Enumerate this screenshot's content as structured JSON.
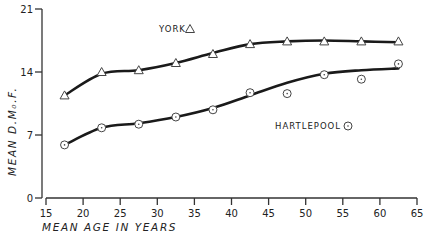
{
  "chart_data": {
    "type": "line",
    "title": "",
    "xlabel": "MEAN AGE IN YEARS",
    "ylabel": "MEAN D.M₀.F.",
    "xlim": [
      15,
      65
    ],
    "ylim": [
      0,
      21
    ],
    "x_ticks": [
      15,
      20,
      25,
      30,
      35,
      40,
      45,
      50,
      55,
      60,
      65
    ],
    "y_ticks": [
      0,
      7,
      14,
      21
    ],
    "grid": false,
    "legend_position": "inline labels",
    "x": [
      17.5,
      22.5,
      27.5,
      32.5,
      37.5,
      42.5,
      47.5,
      52.5,
      57.5,
      62.5
    ],
    "series": [
      {
        "name": "YORK",
        "marker": "triangle",
        "values": [
          11.4,
          14.0,
          14.2,
          15.0,
          16.0,
          17.1,
          17.4,
          17.4,
          17.4,
          17.4
        ],
        "fitted_curve": [
          [
            17.5,
            11.4
          ],
          [
            22.5,
            13.8
          ],
          [
            27.5,
            14.2
          ],
          [
            32.5,
            15.0
          ],
          [
            37.5,
            16.1
          ],
          [
            42.5,
            17.1
          ],
          [
            47.5,
            17.4
          ],
          [
            52.5,
            17.5
          ],
          [
            57.5,
            17.4
          ],
          [
            62.5,
            17.3
          ]
        ]
      },
      {
        "name": "HARTLEPOOL",
        "marker": "circle",
        "values": [
          5.9,
          7.8,
          8.2,
          9.0,
          9.8,
          11.7,
          11.6,
          13.7,
          13.2,
          14.9
        ],
        "fitted_curve": [
          [
            17.5,
            5.9
          ],
          [
            22.5,
            7.8
          ],
          [
            27.5,
            8.3
          ],
          [
            32.5,
            9.0
          ],
          [
            37.5,
            10.0
          ],
          [
            42.5,
            11.4
          ],
          [
            47.5,
            12.8
          ],
          [
            52.5,
            13.8
          ],
          [
            57.5,
            14.2
          ],
          [
            62.5,
            14.4
          ]
        ]
      }
    ]
  },
  "labels": {
    "york": "YORK",
    "hartlepool": "HARTLEPOOL",
    "xlabel": "MEAN AGE IN YEARS",
    "ylabel": "MEAN D.M₀.F."
  }
}
